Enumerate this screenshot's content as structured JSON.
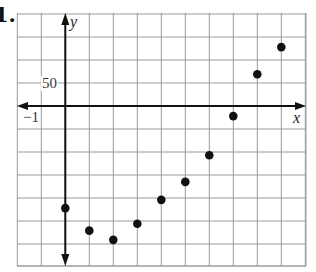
{
  "problem": {
    "number_label": "1."
  },
  "chart_data": {
    "type": "scatter",
    "title": "",
    "xlabel": "x",
    "ylabel": "y",
    "tick_labels": {
      "x": [
        "−1"
      ],
      "y": [
        "50"
      ]
    },
    "x_grid_step": 1,
    "y_grid_step": 50,
    "xlim": [
      -2,
      10
    ],
    "ylim": [
      -300,
      200
    ],
    "grid": true,
    "legend": null,
    "points": [
      {
        "x": 0,
        "y": -222
      },
      {
        "x": 1,
        "y": -271
      },
      {
        "x": 2,
        "y": -291
      },
      {
        "x": 3,
        "y": -256
      },
      {
        "x": 4,
        "y": -204
      },
      {
        "x": 5,
        "y": -165
      },
      {
        "x": 6,
        "y": -107
      },
      {
        "x": 7,
        "y": -22
      },
      {
        "x": 8,
        "y": 69
      },
      {
        "x": 9,
        "y": 128
      }
    ]
  },
  "colors": {
    "grid": "#9a9a9a",
    "axis": "#111111",
    "point": "#111111"
  },
  "layout": {
    "left": 17,
    "right": 306,
    "top": 13,
    "bottom": 266,
    "origin_x": 65.3,
    "origin_y": 106,
    "px_per_x": 24.0,
    "px_per_y": 0.46
  }
}
